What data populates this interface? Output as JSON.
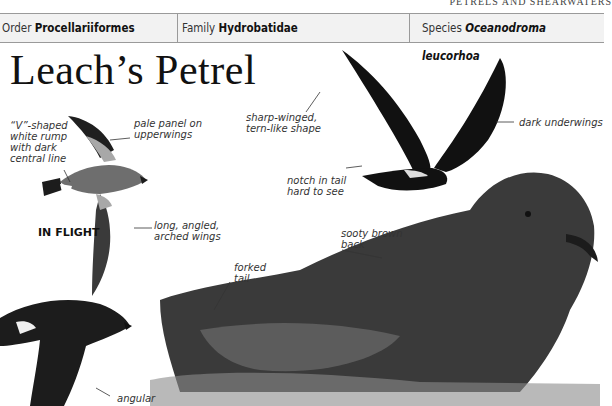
{
  "running_head": "PETRELS AND SHEARWATERS",
  "taxonomy": {
    "order_label": "Order",
    "order_value": "Procellariiformes",
    "family_label": "Family",
    "family_value": "Hydrobatidae",
    "species_label": "Species",
    "species_value": "Oceanodroma leucorhoa"
  },
  "title": "Leach’s Petrel",
  "in_flight_caption": "IN FLIGHT",
  "annotations": {
    "v_rump": [
      "“V”-shaped",
      "white rump",
      "with dark",
      "central line"
    ],
    "pale_panel": [
      "pale panel on",
      "upperwings"
    ],
    "long_wings": [
      "long, angled,",
      "arched wings"
    ],
    "sharp_winged": [
      "sharp-winged,",
      "tern-like shape"
    ],
    "dark_underwings": [
      "dark underwings"
    ],
    "notch_tail": [
      "notch in tail",
      "hard to see"
    ],
    "sooty_back": [
      "sooty brown",
      "back"
    ],
    "forked_tail": [
      "forked",
      "tail"
    ],
    "angular": [
      "angular"
    ]
  },
  "colors": {
    "bar_background": "#f2f2f2",
    "bar_border": "#9a9a9a",
    "bird_dark": "#1c1c1c",
    "bird_grey": "#6e6e6e",
    "pale_panel": "#a8a8a8"
  }
}
